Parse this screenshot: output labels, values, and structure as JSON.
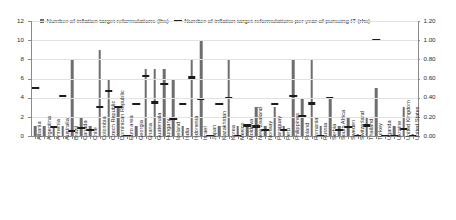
{
  "chart_data": {
    "type": "bar",
    "title": "",
    "xlabel": "",
    "ylabel": "",
    "ylim": [
      0,
      12
    ],
    "y2lim": [
      0,
      1.2
    ],
    "grid": true,
    "legend_position": "top-left",
    "y_ticks": [
      "0",
      "2",
      "4",
      "6",
      "8",
      "10",
      "12"
    ],
    "y2_ticks": [
      "0.00",
      "0.20",
      "0.40",
      "0.60",
      "0.80",
      "1.00",
      "1.20"
    ],
    "categories": [
      "Albania",
      "Argentina",
      "Armenia",
      "Australia",
      "Brazil",
      "Canada",
      "Chile",
      "Colombia",
      "Czech Republic",
      "Dominican Republic",
      "Euro area",
      "Georgia",
      "Ghana",
      "Guatemala",
      "Hungary",
      "Iceland",
      "India",
      "Indonesia",
      "Israel",
      "Japan",
      "Kazakhstan",
      "Korea",
      "Mexico",
      "Moldova",
      "New Zealand",
      "Norway",
      "Paraguay",
      "Peru",
      "Philippines",
      "Poland",
      "Romania",
      "Russia",
      "Serbia",
      "South Africa",
      "Sweden",
      "Switzerland",
      "Thailand",
      "Turkey",
      "Uganda",
      "Ukraine",
      "United Kingdom",
      "United States"
    ],
    "series": [
      {
        "name": "Number of inflation target reformulations (lhs)",
        "axis": "left",
        "type": "bar",
        "color": "#6e6e6e",
        "values": [
          1,
          1,
          1,
          1,
          8,
          2,
          1,
          9,
          6,
          3,
          0,
          1,
          7,
          7,
          7,
          6,
          1,
          8,
          10,
          0,
          1,
          8,
          1,
          1,
          3,
          1,
          3,
          1,
          8,
          4,
          8,
          1,
          4,
          1,
          2,
          0.2,
          2,
          5,
          0.1,
          1,
          3,
          0.2
        ]
      },
      {
        "name": "Number of inflation target reformulations per year of pursuing IT (rhs)",
        "axis": "right",
        "type": "marker",
        "color": "#1b1b1b",
        "values": [
          0.5,
          null,
          0.09,
          0.42,
          0.05,
          0.08,
          0.06,
          0.3,
          0.47,
          0.3,
          0.0,
          0.33,
          0.63,
          0.35,
          0.54,
          0.18,
          0.33,
          0.61,
          0.39,
          0.0,
          0.33,
          0.4,
          0.0,
          0.11,
          0.1,
          0.06,
          0.33,
          0.06,
          0.42,
          0.21,
          0.34,
          0.0,
          0.4,
          0.06,
          0.09,
          0.0,
          0.11,
          1.0,
          0.0,
          0.0,
          0.07,
          0.0
        ]
      }
    ]
  },
  "legend": {
    "bar_label": "Number of inflation target reformulations (lhs)",
    "line_label": "Number of inflation target reformulations per year of pursuing IT (rhs)"
  }
}
